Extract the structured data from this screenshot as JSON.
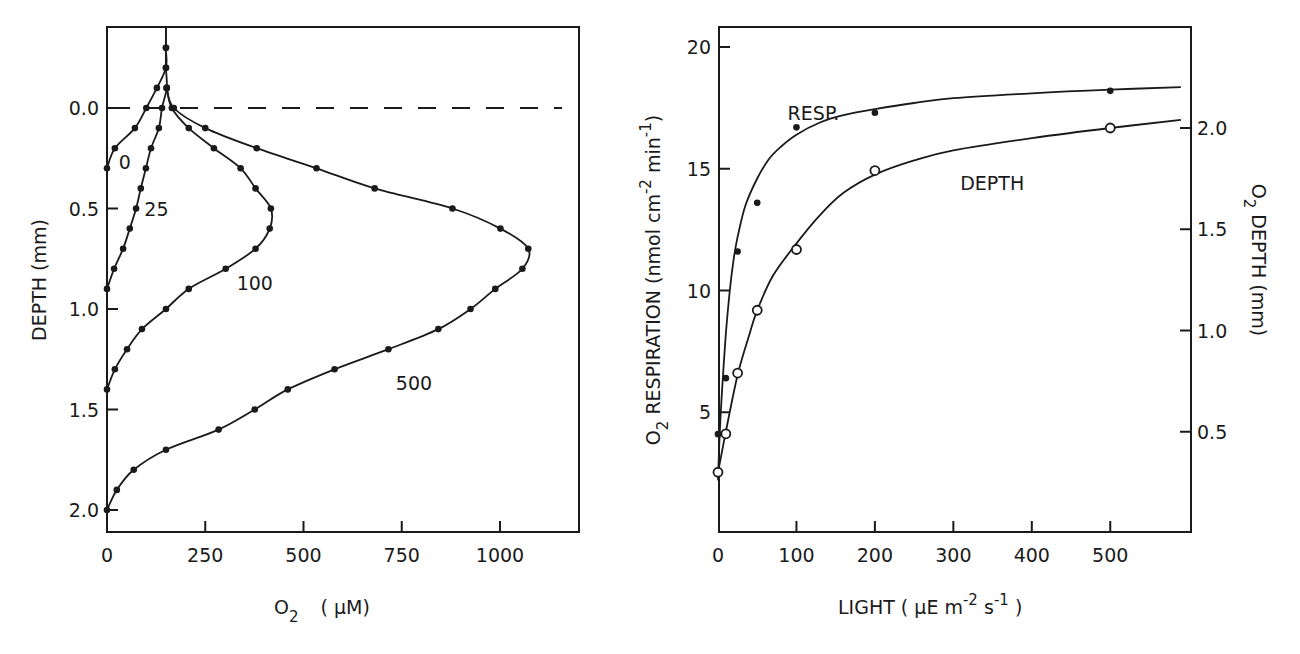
{
  "chart_data": [
    {
      "type": "line",
      "title": "",
      "xlabel": "O2 (µM)",
      "xlabel_main": "O",
      "xlabel_sub": "2",
      "xlabel_unit": "( µM)",
      "ylabel": "DEPTH (mm)",
      "xlim": [
        0,
        1200
      ],
      "ylim": [
        2.1,
        -0.4
      ],
      "y_inverted": true,
      "x_ticks": [
        0,
        250,
        500,
        750,
        1000
      ],
      "x_tick_labels": [
        "0",
        "250",
        "500",
        "750",
        "1000"
      ],
      "y_ticks": [
        0.0,
        0.5,
        1.0,
        1.5,
        2.0
      ],
      "y_tick_labels": [
        "0.0",
        "0.5",
        "1.0",
        "1.5",
        "2.0"
      ],
      "reference_line": {
        "y": 0.0,
        "style": "dashed",
        "label": "sediment surface"
      },
      "grid": false,
      "legend": "inline curve labels",
      "series": [
        {
          "name": "0",
          "label_pos": [
            30,
            0.27
          ],
          "depth": [
            -0.4,
            -0.3,
            -0.2,
            -0.1,
            0.0,
            0.1,
            0.2,
            0.3
          ],
          "o2": [
            150,
            150,
            150,
            127,
            100,
            71,
            20,
            0
          ]
        },
        {
          "name": "25",
          "label_pos": [
            95,
            0.5
          ],
          "depth": [
            -0.4,
            -0.3,
            -0.2,
            -0.1,
            0.0,
            0.1,
            0.2,
            0.3,
            0.4,
            0.5,
            0.6,
            0.7,
            0.8,
            0.9
          ],
          "o2": [
            150,
            150,
            150,
            152,
            140,
            132,
            112,
            99,
            86,
            74,
            58,
            41,
            18,
            0
          ]
        },
        {
          "name": "100",
          "label_pos": [
            330,
            0.87
          ],
          "depth": [
            -0.1,
            0.0,
            0.1,
            0.2,
            0.3,
            0.4,
            0.5,
            0.6,
            0.7,
            0.8,
            0.9,
            1.0,
            1.1,
            1.2,
            1.3,
            1.4
          ],
          "o2": [
            152,
            165,
            208,
            272,
            340,
            378,
            417,
            414,
            378,
            302,
            208,
            150,
            89,
            51,
            20,
            0
          ]
        },
        {
          "name": "500",
          "label_pos": [
            735,
            1.37
          ],
          "depth": [
            -0.1,
            0.0,
            0.1,
            0.2,
            0.3,
            0.4,
            0.5,
            0.6,
            0.7,
            0.8,
            0.9,
            1.0,
            1.1,
            1.2,
            1.3,
            1.4,
            1.5,
            1.6,
            1.7,
            1.8,
            1.9,
            2.0
          ],
          "o2": [
            152,
            170,
            250,
            381,
            533,
            681,
            879,
            1001,
            1072,
            1057,
            988,
            925,
            843,
            716,
            579,
            460,
            376,
            284,
            150,
            68,
            25,
            0
          ]
        }
      ]
    },
    {
      "type": "line",
      "title": "",
      "xlabel": "LIGHT (µE m-2 s-1)",
      "xlabel_parts": {
        "text": "LIGHT  ( µE  m",
        "sup1": "-2",
        "mid": " s",
        "sup2": "-1",
        "end": " )"
      },
      "ylabel_left": "O2 RESPIRATION (nmol cm-2 min-1)",
      "ylabel_left_parts": {
        "o": "O",
        "sub": "2",
        "text": "  RESPIRATION  (nmol cm",
        "sup1": "-2",
        "mid": " min",
        "sup2": "-1",
        "end": ")"
      },
      "ylabel_right": "O2 DEPTH (mm)",
      "ylabel_right_parts": {
        "o": "O",
        "sub": "2",
        "text": "  DEPTH   (mm)"
      },
      "xlim": [
        0,
        600
      ],
      "ylim_left": [
        0,
        21
      ],
      "ylim_right": [
        0,
        2.6
      ],
      "x_ticks": [
        0,
        100,
        200,
        300,
        400,
        500
      ],
      "x_tick_labels": [
        "0",
        "100",
        "200",
        "300",
        "400",
        "500"
      ],
      "y_left_ticks": [
        5,
        10,
        15,
        20
      ],
      "y_left_tick_labels": [
        "5",
        "10",
        "15",
        "20"
      ],
      "y_right_ticks": [
        0.5,
        1.0,
        1.5,
        2.0
      ],
      "y_right_tick_labels": [
        "0.5",
        "1.0",
        "1.5",
        "2.0"
      ],
      "grid": false,
      "legend": "inline curve labels",
      "series": [
        {
          "name": "RESP.",
          "axis": "left",
          "marker": "filled-circle",
          "x": [
            0,
            10,
            25,
            50,
            100,
            200,
            500
          ],
          "y": [
            4.1,
            6.4,
            11.6,
            13.6,
            16.7,
            17.3,
            18.2
          ],
          "fit_x": [
            0,
            2,
            5,
            10,
            15,
            20,
            25,
            35,
            50,
            65,
            80,
            100,
            130,
            160,
            200,
            250,
            300,
            400,
            500,
            590
          ],
          "fit_y": [
            2.2,
            4.0,
            5.8,
            8.2,
            10.0,
            11.3,
            12.2,
            13.5,
            14.6,
            15.4,
            15.9,
            16.4,
            16.9,
            17.2,
            17.45,
            17.7,
            17.9,
            18.1,
            18.25,
            18.35
          ],
          "label_pos": [
            25,
            17.3
          ]
        },
        {
          "name": "DEPTH",
          "axis": "right",
          "marker": "open-circle",
          "x": [
            0,
            10,
            25,
            50,
            100,
            200,
            500
          ],
          "y": [
            0.3,
            0.49,
            0.79,
            1.1,
            1.4,
            1.79,
            2.0
          ],
          "fit_x": [
            0,
            10,
            25,
            40,
            50,
            70,
            100,
            130,
            160,
            200,
            250,
            300,
            400,
            500,
            590
          ],
          "fit_y": [
            0.3,
            0.5,
            0.78,
            0.98,
            1.1,
            1.27,
            1.43,
            1.57,
            1.68,
            1.77,
            1.84,
            1.89,
            1.95,
            2.0,
            2.04
          ],
          "label_pos": [
            245,
            1.73
          ]
        }
      ]
    }
  ]
}
